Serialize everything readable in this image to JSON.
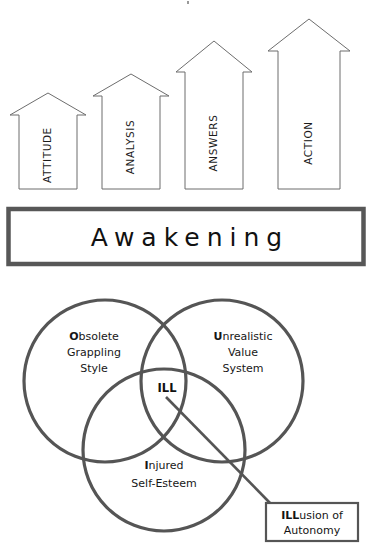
{
  "diagram": {
    "colors": {
      "arrow_stroke": "#6d6d6d",
      "bar_stroke": "#575757",
      "circle_stroke": "#555555",
      "text": "#171717",
      "background": "#ffffff"
    },
    "arrows": {
      "name": "ascending-arrows",
      "items": [
        {
          "label": "ATTITUDE",
          "order": 1
        },
        {
          "label": "ANALYSIS",
          "order": 2
        },
        {
          "label": "ANSWERS",
          "order": 3
        },
        {
          "label": "ACTION",
          "order": 4
        }
      ]
    },
    "foundation_bar": {
      "label": "Awakening"
    },
    "venn": {
      "circles": [
        {
          "id": "obsolete",
          "lead": "O",
          "rest": "bsolete",
          "lines": [
            "Obsolete",
            "Grappling",
            "Style"
          ]
        },
        {
          "id": "unrealistic",
          "lead": "U",
          "rest": "nrealistic",
          "lines": [
            "Unrealistic",
            "Value",
            "System"
          ]
        },
        {
          "id": "injured",
          "lead": "I",
          "rest": "njured",
          "lines": [
            "Injured",
            "Self-Esteem"
          ]
        }
      ],
      "intersection_label": "ILL",
      "callout": {
        "lead": "ILL",
        "rest": "usion of",
        "line2": "Autonomy"
      }
    }
  }
}
